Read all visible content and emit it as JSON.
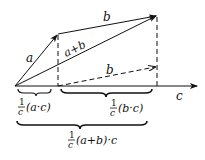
{
  "diagram": {
    "vectors": {
      "a": "a",
      "b": "b",
      "a_plus_b": "a+b",
      "b_shifted": "b",
      "axis": "c"
    },
    "braces": {
      "proj_a": {
        "num": "1",
        "den": "c",
        "expr": "(a·c)"
      },
      "proj_b": {
        "num": "1",
        "den": "c",
        "expr": "(b·c)"
      },
      "proj_sum": {
        "num": "1",
        "den": "c",
        "expr": "(a+b)·c"
      }
    },
    "colors": {
      "stroke": "#111111",
      "background": "#ffffff"
    }
  }
}
